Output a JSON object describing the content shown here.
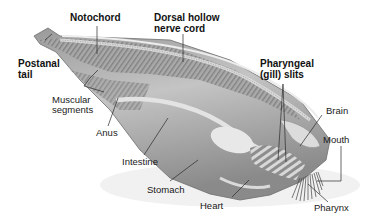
{
  "diagram": {
    "colors": {
      "background": "#ffffff",
      "body_fill": "#b8b8b8",
      "body_dark": "#7a7a7a",
      "body_light": "#e6e6e6",
      "label_text": "#1a1a1a",
      "leader_line": "#333333"
    },
    "labels": {
      "notochord": "Notochord",
      "dorsal_nerve_cord_line1": "Dorsal hollow",
      "dorsal_nerve_cord_line2": "nerve cord",
      "postanal_tail_line1": "Postanal",
      "postanal_tail_line2": "tail",
      "pharyngeal_slits_line1": "Pharyngeal",
      "pharyngeal_slits_line2": "(gill) slits",
      "muscular_segments_line1": "Muscular",
      "muscular_segments_line2": "segments",
      "brain": "Brain",
      "mouth": "Mouth",
      "anus": "Anus",
      "intestine": "Intestine",
      "stomach": "Stomach",
      "heart": "Heart",
      "pharynx": "Pharynx"
    }
  }
}
